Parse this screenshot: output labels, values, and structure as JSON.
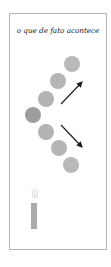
{
  "diagram": {
    "title": "o que de fato acontece",
    "colors": {
      "frame": "#b5b5b5",
      "circle_light": "#b8b8b8",
      "circle_dark": "#9c9c9c",
      "arrow": "#1a1a1a",
      "candle": "#aaaaaa"
    },
    "circles": [
      {
        "cx": 72,
        "cy": 64,
        "r": 8,
        "fill": "#b9b9b9"
      },
      {
        "cx": 58,
        "cy": 81,
        "r": 8,
        "fill": "#b5b5b5"
      },
      {
        "cx": 46,
        "cy": 99,
        "r": 8,
        "fill": "#b3b3b3"
      },
      {
        "cx": 33,
        "cy": 115,
        "r": 8,
        "fill": "#9e9e9e"
      },
      {
        "cx": 46,
        "cy": 132,
        "r": 8,
        "fill": "#b3b3b3"
      },
      {
        "cx": 59,
        "cy": 148,
        "r": 8,
        "fill": "#b5b5b5"
      },
      {
        "cx": 71,
        "cy": 165,
        "r": 8,
        "fill": "#b9b9b9"
      }
    ],
    "arrows": [
      {
        "name": "arrow-up-right",
        "x1": 61,
        "y1": 104,
        "x2": 82,
        "y2": 82
      },
      {
        "name": "arrow-down-right",
        "x1": 61,
        "y1": 125,
        "x2": 82,
        "y2": 147
      }
    ],
    "candle": {
      "x": 31,
      "y": 203,
      "w": 6,
      "h": 26
    }
  }
}
